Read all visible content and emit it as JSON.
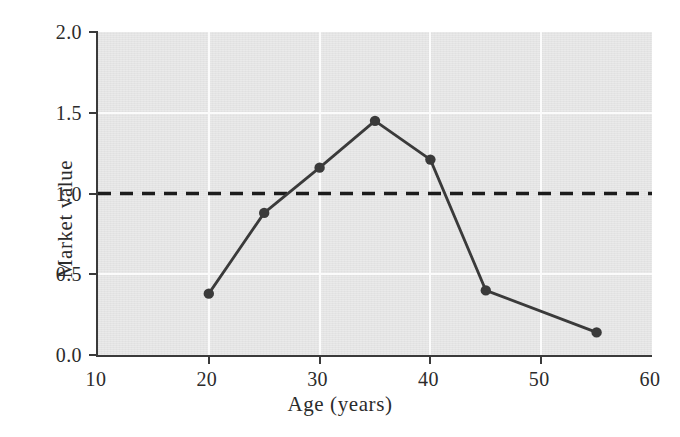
{
  "figure": {
    "background_color": "#ffffff",
    "plot_background_color": "#e4e4e4",
    "gridline_color": "#fbfbfb",
    "axis_color": "#3a3a3a",
    "series_color": "#3a3a3a"
  },
  "chart_data": {
    "type": "line",
    "title": "",
    "xlabel": "Age (years)",
    "ylabel": "Market value",
    "xlim": [
      10,
      60
    ],
    "ylim": [
      0.0,
      2.0
    ],
    "xticks": [
      10,
      20,
      30,
      40,
      50,
      60
    ],
    "xtick_labels": [
      "10",
      "20",
      "30",
      "40",
      "50",
      "60"
    ],
    "yticks": [
      0.0,
      0.5,
      1.0,
      1.5,
      2.0
    ],
    "ytick_labels": [
      "0.0",
      "0.5",
      "1.0",
      "1.5",
      "2.0"
    ],
    "grid": true,
    "grid_color": "#fbfbfb",
    "legend": null,
    "x": [
      20,
      25,
      30,
      35,
      40,
      45,
      55
    ],
    "y": [
      0.38,
      0.88,
      1.16,
      1.45,
      1.21,
      0.4,
      0.14
    ],
    "series": [
      {
        "name": "Market value",
        "marker": "filled-circle",
        "line_style": "solid",
        "color": "#3a3a3a",
        "points": [
          {
            "x": 20,
            "y": 0.38
          },
          {
            "x": 25,
            "y": 0.88
          },
          {
            "x": 30,
            "y": 1.16
          },
          {
            "x": 35,
            "y": 1.45
          },
          {
            "x": 40,
            "y": 1.21
          },
          {
            "x": 45,
            "y": 0.4
          },
          {
            "x": 55,
            "y": 0.14
          }
        ]
      }
    ],
    "reference_lines": [
      {
        "name": "break-even",
        "orientation": "horizontal",
        "value": 1.0,
        "line_style": "dashed",
        "color": "#1c1c1c"
      }
    ],
    "annotations": []
  },
  "caption": {
    "partial_text": ""
  }
}
